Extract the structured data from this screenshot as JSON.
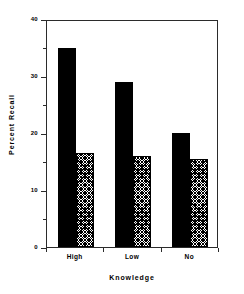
{
  "chart_data": {
    "type": "bar",
    "title": "",
    "xlabel": "Knowledge",
    "ylabel": "Percent Recall",
    "categories": [
      "High",
      "Low",
      "No"
    ],
    "series": [
      {
        "name": "solid",
        "fill": "solid-black",
        "values": [
          35,
          29,
          20
        ]
      },
      {
        "name": "hatched",
        "fill": "cross-hatch",
        "values": [
          16.5,
          16,
          15.5
        ]
      }
    ],
    "ylim": [
      0,
      40
    ],
    "ytick_labels": [
      "0",
      "10",
      "20",
      "30",
      "40"
    ],
    "ytick_values": [
      0,
      10,
      20,
      30,
      40
    ],
    "yminor_values": [
      5,
      15,
      25,
      35
    ],
    "grid": false,
    "legend": "none",
    "colors": {
      "bar_solid": "#000000",
      "bar_hatch_line": "#000000",
      "axis": "#2b2b2b",
      "background": "#ffffff"
    }
  }
}
